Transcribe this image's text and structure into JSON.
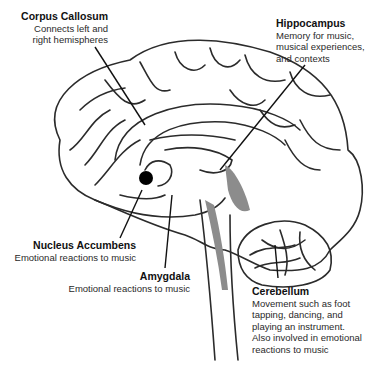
{
  "diagram": {
    "colors": {
      "outline": "#2b2b2b",
      "shade": "#8c8c8c",
      "marker": "#000000",
      "background": "#ffffff"
    },
    "labels": [
      {
        "id": "corpus-callosum",
        "title": "Corpus Callosum",
        "lines": [
          "Connects left and",
          "right hemispheres"
        ]
      },
      {
        "id": "hippocampus",
        "title": "Hippocampus",
        "lines": [
          "Memory for music,",
          "musical experiences,",
          "and contexts"
        ]
      },
      {
        "id": "nucleus-accumbens",
        "title": "Nucleus Accumbens",
        "lines": [
          "Emotional reactions to music"
        ]
      },
      {
        "id": "amygdala",
        "title": "Amygdala",
        "lines": [
          "Emotional reactions to music"
        ]
      },
      {
        "id": "cerebellum",
        "title": "Cerebellum",
        "lines": [
          "Movement such as foot",
          "tapping, dancing, and",
          "playing an instrument.",
          "Also involved in emotional",
          "reactions to music"
        ]
      }
    ]
  }
}
